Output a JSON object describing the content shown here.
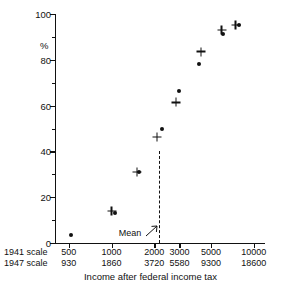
{
  "chart_data": {
    "type": "scatter",
    "title": "",
    "xlabel": "Income after federal income tax",
    "ylabel": "%",
    "xscale": "log",
    "xlim": [
      400,
      12000
    ],
    "ylim": [
      0,
      100
    ],
    "grid": false,
    "legend": "none",
    "y_ticks_major": [
      0,
      20,
      40,
      60,
      80,
      100
    ],
    "y_ticks_minor": [
      10,
      30,
      50,
      70,
      90
    ],
    "x_scale_rows": [
      {
        "name": "1941 scale",
        "label": "1941 scale",
        "ticks": [
          500,
          1000,
          2000,
          3000,
          5000,
          10000
        ],
        "tick_labels": [
          "500",
          "1000",
          "2000",
          "3000",
          "5000",
          "10000"
        ]
      },
      {
        "name": "1947 scale",
        "label": "1947 scale",
        "ticks": [
          500,
          1000,
          2000,
          3000,
          5000,
          10000
        ],
        "tick_labels": [
          "930",
          "1860",
          "3720",
          "5580",
          "9300",
          "18600"
        ]
      }
    ],
    "annotations": [
      {
        "text": "Mean",
        "x": 2150,
        "y": 4,
        "line_x": 2150,
        "line_y_top": 40
      }
    ],
    "series": [
      {
        "name": "dots",
        "marker": "dot",
        "points": [
          {
            "x": 520,
            "y": 3.5
          },
          {
            "x": 1060,
            "y": 13.0
          },
          {
            "x": 1560,
            "y": 31.0
          },
          {
            "x": 2260,
            "y": 49.7
          },
          {
            "x": 2960,
            "y": 66.3
          },
          {
            "x": 4100,
            "y": 78.3
          },
          {
            "x": 6100,
            "y": 91.2
          },
          {
            "x": 7900,
            "y": 95.0
          }
        ]
      },
      {
        "name": "pluses",
        "marker": "plus",
        "points": [
          {
            "x": 1000,
            "y": 14.1
          },
          {
            "x": 1510,
            "y": 31.0
          },
          {
            "x": 2080,
            "y": 46.4
          },
          {
            "x": 2830,
            "y": 61.4
          },
          {
            "x": 4250,
            "y": 83.6
          },
          {
            "x": 5950,
            "y": 93.0
          },
          {
            "x": 7450,
            "y": 95.3
          }
        ]
      }
    ]
  }
}
